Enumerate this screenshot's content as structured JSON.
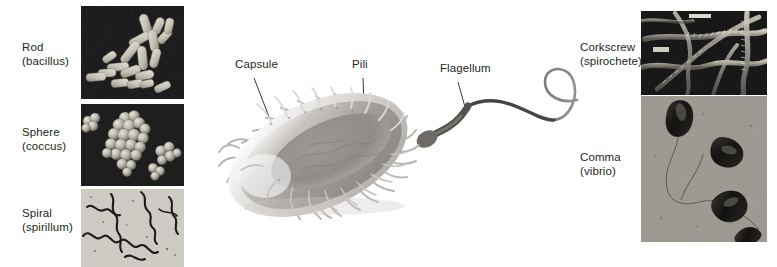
{
  "figure": {
    "background_color": "#ffffff",
    "text_color": "#231f20"
  },
  "left_panels": [
    {
      "name": "rod",
      "label_line1": "Rod",
      "label_line2": "(bacillus)",
      "micrograph": "scanning-electron-micrograph-rod-shaped-bacteria",
      "background_color": "#141414",
      "cell_color": "#cfcac0"
    },
    {
      "name": "sphere",
      "label_line1": "Sphere",
      "label_line2": "(coccus)",
      "micrograph": "scanning-electron-micrograph-spherical-bacteria",
      "background_color": "#121212",
      "cell_color": "#b9b4ab"
    },
    {
      "name": "spiral",
      "label_line1": "Spiral",
      "label_line2": "(spirillum)",
      "micrograph": "light-micrograph-spiral-bacteria",
      "background_color": "#cfccc4",
      "cell_color": "#1c1a18"
    }
  ],
  "right_panels": [
    {
      "name": "corkscrew",
      "label_line1": "Corkscrew",
      "label_line2": "(spirochete)",
      "micrograph": "electron-micrograph-spirochete-bacteria",
      "background_color": "#0e0e0e",
      "cell_color": "#b3aea4"
    },
    {
      "name": "comma",
      "label_line1": "Comma",
      "label_line2": "(vibrio)",
      "micrograph": "electron-micrograph-vibrio-bacteria",
      "background_color": "#9b9890",
      "cell_color": "#121110"
    }
  ],
  "callouts": [
    {
      "name": "capsule",
      "label": "Capsule"
    },
    {
      "name": "pili",
      "label": "Pili"
    },
    {
      "name": "flagellum",
      "label": "Flagellum"
    }
  ],
  "illustration": {
    "name": "prokaryotic-bacterium-diagram",
    "body_color": "#a9a5a0",
    "capsule_color": "#d8d5d1",
    "flagellum_color": "#5a5754"
  }
}
